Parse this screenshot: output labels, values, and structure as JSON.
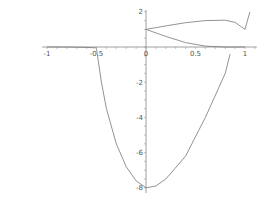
{
  "chart_data": {
    "type": "line",
    "title": "",
    "xlabel": "",
    "ylabel": "",
    "xlim": [
      -1.0,
      1.05
    ],
    "ylim": [
      -8.2,
      2.1
    ],
    "grid": false,
    "legend": null,
    "x_ticks": [
      "-1",
      "-0.5",
      "0",
      "0.5",
      "1"
    ],
    "y_ticks": [
      "2",
      "-2",
      "-4",
      "-6",
      "-8"
    ],
    "series": [
      {
        "name": "upper-branch",
        "x": [
          0,
          0.2,
          0.4,
          0.6,
          0.8,
          0.9,
          1.0,
          1.05
        ],
        "y": [
          1.0,
          1.2,
          1.38,
          1.5,
          1.52,
          1.4,
          1.0,
          2.0
        ]
      },
      {
        "name": "lower-branch",
        "x": [
          0,
          0.2,
          0.4,
          0.6,
          0.8,
          1.0
        ],
        "y": [
          1.0,
          0.6,
          0.25,
          0.05,
          0.0,
          0.0
        ]
      },
      {
        "name": "tail-left",
        "x": [
          -1.0,
          -0.8,
          -0.6,
          -0.5
        ],
        "y": [
          0.0,
          0.0,
          -0.02,
          -0.05
        ]
      },
      {
        "name": "parabola",
        "x": [
          -0.5,
          -0.45,
          -0.4,
          -0.3,
          -0.2,
          -0.1,
          0.0,
          0.1,
          0.2,
          0.4,
          0.6,
          0.8,
          0.85
        ],
        "y": [
          -0.1,
          -2.0,
          -3.5,
          -5.5,
          -6.8,
          -7.6,
          -8.0,
          -7.9,
          -7.5,
          -6.2,
          -4.0,
          -1.5,
          -0.4
        ]
      }
    ]
  }
}
